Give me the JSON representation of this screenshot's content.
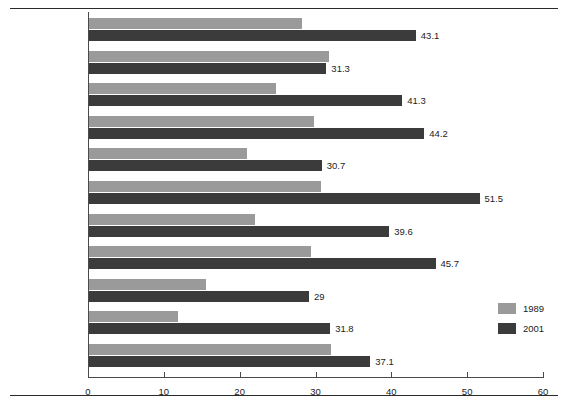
{
  "chart_data": {
    "type": "bar",
    "orientation": "horizontal",
    "title": "",
    "xlabel": "",
    "ylabel": "",
    "xlim": [
      0,
      60
    ],
    "xticks": [
      0,
      10,
      20,
      30,
      40,
      50,
      60
    ],
    "grid": false,
    "legend_position": "right",
    "categories": [
      "CANADA",
      "BC",
      "Alberta",
      "Saskatchewan",
      "Manitoba",
      "Ontario",
      "Quebec",
      "New Brunswick",
      "Nova Scotia",
      "PEI",
      "Newfoundland"
    ],
    "series": [
      {
        "name": "1989",
        "color": "#9a9a9a",
        "values": [
          28.1,
          31.7,
          24.6,
          29.7,
          20.8,
          30.6,
          21.9,
          29.3,
          15.4,
          11.7,
          31.9
        ],
        "labels_shown": false
      },
      {
        "name": "2001",
        "color": "#3b3b3b",
        "values": [
          43.1,
          31.3,
          41.3,
          44.2,
          30.7,
          51.5,
          39.6,
          45.7,
          29,
          31.8,
          37.1
        ],
        "labels_shown": true,
        "value_labels": [
          "43.1",
          "31.3",
          "41.3",
          "44.2",
          "30.7",
          "51.5",
          "39.6",
          "45.7",
          "29",
          "31.8",
          "37.1"
        ]
      }
    ]
  },
  "axis": {
    "tick_labels": [
      "0",
      "10",
      "20",
      "30",
      "40",
      "50",
      "60"
    ]
  },
  "legend": {
    "items": [
      {
        "label": "1989",
        "color": "#9a9a9a"
      },
      {
        "label": "2001",
        "color": "#3b3b3b"
      }
    ]
  }
}
